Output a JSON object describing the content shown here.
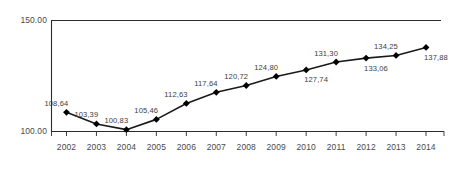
{
  "chart_data": {
    "type": "line",
    "title": "",
    "subtitle": "",
    "xlabel": "",
    "ylabel": "",
    "categories": [
      "2002",
      "2003",
      "2004",
      "2005",
      "2006",
      "2007",
      "2008",
      "2009",
      "2010",
      "2011",
      "2012",
      "2013",
      "2014"
    ],
    "values": [
      108.64,
      103.39,
      100.83,
      105.46,
      112.63,
      117.64,
      120.72,
      124.8,
      127.74,
      131.3,
      133.06,
      134.25,
      137.88
    ],
    "point_labels": [
      "108,64",
      "103,39",
      "100,83",
      "105,46",
      "112,63",
      "117,64",
      "120,72",
      "124,80",
      "127,74",
      "131,30",
      "133,06",
      "134,25",
      "137,88"
    ],
    "label_placement": [
      "above",
      "above",
      "above",
      "above",
      "above",
      "above",
      "above",
      "above",
      "below",
      "above",
      "below",
      "above",
      "below"
    ],
    "ylim": [
      100.0,
      150.0
    ],
    "y_tick_values": [
      100.0,
      150.0
    ],
    "y_tick_labels": [
      "100.00",
      "150.00"
    ],
    "grid": true,
    "gridlines": [
      "150.00"
    ],
    "legend": null,
    "legend_position": "none",
    "series_name": "",
    "marker": "diamond",
    "marker_color": "#000000",
    "line_color": "#1a1a1a",
    "text_color": "#3d3d3d",
    "background_color": "#ffffff"
  }
}
